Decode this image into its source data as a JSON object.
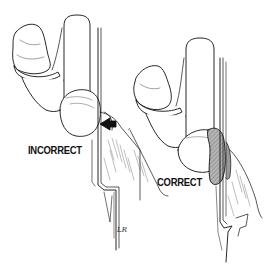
{
  "figure": {
    "type": "medical line illustration",
    "panels": [
      {
        "id": "left",
        "label": "INCORRECT",
        "shows": "pressure point arrow against tube/edge"
      },
      {
        "id": "right",
        "label": "CORRECT",
        "shows": "padding (shaded) between limb and edge"
      }
    ],
    "signature": "LR"
  },
  "colors": {
    "ink": "#111111",
    "background": "#ffffff",
    "pad_fill": "#9a9a9a"
  }
}
